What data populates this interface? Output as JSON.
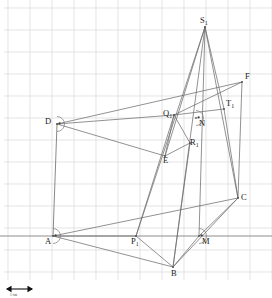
{
  "figure": {
    "background_color": "#ffffff",
    "grid": {
      "visible": true,
      "color": "#d8d8d8",
      "spacing_px": 22,
      "x_start": 8,
      "y_start": 8,
      "columns": 12,
      "rows": 12
    },
    "stroke_color": "#6e6e6e",
    "label_color": "#1b1b1b"
  },
  "scale": {
    "label": "1 cm",
    "bar_length_px": 26
  },
  "points": [
    {
      "id": "S1",
      "label": "S",
      "sub": "1",
      "x": 205,
      "y": 27,
      "lx": 200,
      "ly": 23
    },
    {
      "id": "F",
      "label": "F",
      "sub": "",
      "x": 242,
      "y": 82,
      "lx": 245,
      "ly": 79
    },
    {
      "id": "T1",
      "label": "T",
      "sub": "1",
      "x": 224,
      "y": 109,
      "lx": 226,
      "ly": 106
    },
    {
      "id": "Q1",
      "label": "Q",
      "sub": "1",
      "x": 174,
      "y": 115,
      "lx": 163,
      "ly": 116
    },
    {
      "id": "N",
      "label": "N",
      "sub": "",
      "x": 196,
      "y": 118,
      "lx": 199,
      "ly": 126
    },
    {
      "id": "D",
      "label": "D",
      "sub": "",
      "x": 57,
      "y": 124,
      "lx": 45,
      "ly": 124
    },
    {
      "id": "R1",
      "label": "R",
      "sub": "1",
      "x": 190,
      "y": 143,
      "lx": 190,
      "ly": 145
    },
    {
      "id": "E",
      "label": "E",
      "sub": "",
      "x": 165,
      "y": 156,
      "lx": 163,
      "ly": 163
    },
    {
      "id": "C",
      "label": "C",
      "sub": "",
      "x": 238,
      "y": 198,
      "lx": 241,
      "ly": 200
    },
    {
      "id": "A",
      "label": "A",
      "sub": "",
      "x": 53,
      "y": 236,
      "lx": 45,
      "ly": 244
    },
    {
      "id": "P1",
      "label": "P",
      "sub": "1",
      "x": 136,
      "y": 236,
      "lx": 131,
      "ly": 244
    },
    {
      "id": "M",
      "label": "M",
      "sub": "",
      "x": 199,
      "y": 236,
      "lx": 202,
      "ly": 244
    },
    {
      "id": "B",
      "label": "B",
      "sub": "",
      "x": 173,
      "y": 267,
      "lx": 171,
      "ly": 276
    }
  ],
  "right_angle_markers": [
    {
      "at": "D",
      "name": "right-angle-marker-d"
    },
    {
      "at": "A",
      "name": "right-angle-marker-a"
    },
    {
      "at": "M",
      "name": "right-angle-marker-m"
    },
    {
      "at": "N",
      "name": "right-angle-marker-n"
    }
  ],
  "segments": [
    {
      "from": "S1",
      "to": "P1"
    },
    {
      "from": "S1",
      "to": "B"
    },
    {
      "from": "S1",
      "to": "M"
    },
    {
      "from": "S1",
      "to": "C"
    },
    {
      "from": "S1",
      "to": "E"
    },
    {
      "from": "S1",
      "to": "T1"
    },
    {
      "from": "D",
      "to": "F"
    },
    {
      "from": "D",
      "to": "E"
    },
    {
      "from": "D",
      "to": "A"
    },
    {
      "from": "D",
      "to": "Q1"
    },
    {
      "from": "F",
      "to": "C"
    },
    {
      "from": "F",
      "to": "Q1"
    },
    {
      "from": "A",
      "to": "B"
    },
    {
      "from": "A",
      "to": "C"
    },
    {
      "from": "A",
      "to": "P1"
    },
    {
      "from": "P1",
      "to": "B"
    },
    {
      "from": "P1",
      "to": "Q1"
    },
    {
      "from": "B",
      "to": "M"
    },
    {
      "from": "B",
      "to": "C"
    },
    {
      "from": "B",
      "to": "R1"
    },
    {
      "from": "Q1",
      "to": "E"
    },
    {
      "from": "Q1",
      "to": "R1"
    },
    {
      "from": "E",
      "to": "R1"
    },
    {
      "from": "T1",
      "to": "C"
    },
    {
      "from": "T1",
      "to": "Q1"
    },
    {
      "from": "M",
      "to": "C"
    }
  ],
  "baseline": {
    "x1": 0,
    "x2": 272,
    "y": 236,
    "name": "ground-line"
  }
}
